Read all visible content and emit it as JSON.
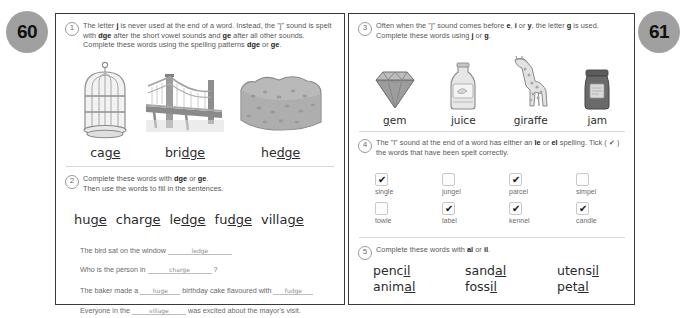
{
  "spread": {
    "left_page_number": "60",
    "right_page_number": "61",
    "badge_color": "#a0a0a0"
  },
  "exercises": [
    {
      "number": "1",
      "instruction_parts": [
        "The letter ",
        "j",
        " is never used at the end of a word. Instead, the \"j\" sound is spelt with ",
        "dge",
        " after the short vowel sounds and ",
        "ge",
        " after all other sounds. Complete these words using the spelling patterns ",
        "dge",
        " or ",
        "ge",
        "."
      ],
      "pictures": [
        {
          "icon": "birdcage-icon",
          "word_stem": "ca",
          "word_answer": "ge",
          "full": "cage"
        },
        {
          "icon": "bridge-icon",
          "word_stem": "bri",
          "word_answer": "dge",
          "full": "bridge"
        },
        {
          "icon": "hedge-icon",
          "word_stem": "he",
          "word_answer": "dge",
          "full": "hedge"
        }
      ]
    },
    {
      "number": "2",
      "instruction_line1_parts": [
        "Complete these words with ",
        "dge",
        " or ",
        "ge",
        "."
      ],
      "instruction_line2": "Then use the words to fill in the sentences.",
      "word_bank": [
        {
          "stem": "hu",
          "answer": "ge",
          "full": "huge"
        },
        {
          "stem": "char",
          "answer": "ge",
          "full": "charge"
        },
        {
          "stem": "le",
          "answer": "dge",
          "full": "ledge"
        },
        {
          "stem": "fu",
          "answer": "dge",
          "full": "fudge"
        },
        {
          "stem": "villa",
          "answer": "ge",
          "full": "village"
        }
      ],
      "sentences": [
        {
          "before": "The bird sat on the window",
          "answer": "ledge",
          "after": ""
        },
        {
          "before": "Who is the person in",
          "answer": "charge",
          "after": "?"
        },
        {
          "before": "The baker made a",
          "answer": "huge",
          "mid": "birthday cake flavoured with",
          "answer2": "fudge",
          "after": ""
        },
        {
          "before": "Everyone in the",
          "answer": "village",
          "after": "was excited about the mayor's visit."
        }
      ]
    },
    {
      "number": "3",
      "instruction_parts": [
        "Often when the \"j\" sound comes before ",
        "e",
        ", ",
        "i",
        " or ",
        "y",
        ", the letter ",
        "g",
        " is used. Complete these words using ",
        "j",
        " or ",
        "g",
        "."
      ],
      "pictures": [
        {
          "icon": "gem-icon",
          "word_stem": "",
          "word_answer": "g",
          "rest": "em",
          "full": "gem"
        },
        {
          "icon": "juice-icon",
          "word_stem": "",
          "word_answer": "j",
          "rest": "uice",
          "full": "juice"
        },
        {
          "icon": "giraffe-icon",
          "word_stem": "",
          "word_answer": "g",
          "rest": "iraffe",
          "full": "giraffe"
        },
        {
          "icon": "jam-icon",
          "word_stem": "",
          "word_answer": "j",
          "rest": "am",
          "full": "jam"
        }
      ]
    },
    {
      "number": "4",
      "instruction_parts": [
        "The \"l\" sound at the end of a word has either an ",
        "le",
        " or ",
        "el",
        " spelling. Tick ( ✔ ) the words that have been spelt correctly."
      ],
      "checkbox_items": [
        {
          "label": "single",
          "checked": true
        },
        {
          "label": "jungel",
          "checked": false
        },
        {
          "label": "parcel",
          "checked": true
        },
        {
          "label": "simpel",
          "checked": false
        },
        {
          "label": "towle",
          "checked": false
        },
        {
          "label": "label",
          "checked": true
        },
        {
          "label": "kennel",
          "checked": true
        },
        {
          "label": "candle",
          "checked": true
        }
      ],
      "tick_glyph": "✔"
    },
    {
      "number": "5",
      "instruction_parts": [
        "Complete these words with ",
        "al",
        " or ",
        "il",
        "."
      ],
      "words": [
        {
          "stem": "penc",
          "answer": "il",
          "full": "pencil"
        },
        {
          "stem": "sand",
          "answer": "al",
          "full": "sandal"
        },
        {
          "stem": "utens",
          "answer": "il",
          "full": "utensil"
        },
        {
          "stem": "anim",
          "answer": "al",
          "full": "animal"
        },
        {
          "stem": "foss",
          "answer": "il",
          "full": "fossil"
        },
        {
          "stem": "pet",
          "answer": "al",
          "full": "petal"
        }
      ]
    }
  ]
}
